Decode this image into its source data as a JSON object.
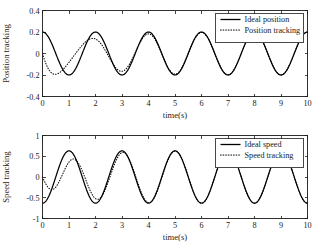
{
  "figure": {
    "background": "#ffffff",
    "foreground": "#000000",
    "width": 318,
    "height": 250
  },
  "chart_data": [
    {
      "id": "position-tracking",
      "type": "line",
      "title": "",
      "xlabel": "time(s)",
      "ylabel": "Position tracking",
      "xlim": [
        0,
        10
      ],
      "ylim": [
        -0.4,
        0.4
      ],
      "xticks": [
        0,
        1,
        2,
        3,
        4,
        5,
        6,
        7,
        8,
        9,
        10
      ],
      "xticklabels": [
        "0",
        "1",
        "2",
        "3",
        "4",
        "5",
        "6",
        "7",
        "8",
        "9",
        "10"
      ],
      "yticks": [
        -0.4,
        -0.2,
        0,
        0.2,
        0.4
      ],
      "yticklabels": [
        "-0.4",
        "-0.2",
        "0",
        "0.2",
        "0.4"
      ],
      "grid": false,
      "legend_position": "upper right",
      "series": [
        {
          "name": "Ideal position",
          "style": "solid",
          "color": "#000000",
          "formula": "0.2*cos(pi*t)",
          "amplitude": 0.2,
          "period": 2.0,
          "phase_deg": 0,
          "offset": 0
        },
        {
          "name": "Position tracking",
          "style": "dotted",
          "color": "#000000",
          "formula": "0.2*cos(pi*t) + transient",
          "amplitude": 0.2,
          "period": 2.0,
          "phase_deg": 0,
          "offset": 0,
          "initial_value": 0.0,
          "transient_note": "starts at 0, undershoots to about -0.26 near t=0.9, converges to ideal by t~1.8"
        }
      ]
    },
    {
      "id": "speed-tracking",
      "type": "line",
      "title": "",
      "xlabel": "time(s)",
      "ylabel": "Speed tracking",
      "xlim": [
        0,
        10
      ],
      "ylim": [
        -1,
        1
      ],
      "xticks": [
        0,
        1,
        2,
        3,
        4,
        5,
        6,
        7,
        8,
        9,
        10
      ],
      "xticklabels": [
        "0",
        "1",
        "2",
        "3",
        "4",
        "5",
        "6",
        "7",
        "8",
        "9",
        "10"
      ],
      "yticks": [
        -1,
        -0.5,
        0,
        0.5,
        1
      ],
      "yticklabels": [
        "-1",
        "-0.5",
        "0",
        "0.5",
        "1"
      ],
      "grid": false,
      "legend_position": "upper right",
      "series": [
        {
          "name": "Ideal speed",
          "style": "solid",
          "color": "#000000",
          "formula": "-0.63*sin(pi*t)",
          "amplitude": 0.63,
          "period": 2.0,
          "phase_deg": 180,
          "offset": 0
        },
        {
          "name": "Speed tracking",
          "style": "dotted",
          "color": "#000000",
          "formula": "-0.63*sin(pi*t) + transient",
          "amplitude": 0.63,
          "period": 2.0,
          "phase_deg": 180,
          "offset": 0,
          "initial_value": 0.0,
          "transient_note": "initial dip slightly shallower then deeper near t=0.5, converges to ideal by t~1.5"
        }
      ]
    }
  ]
}
